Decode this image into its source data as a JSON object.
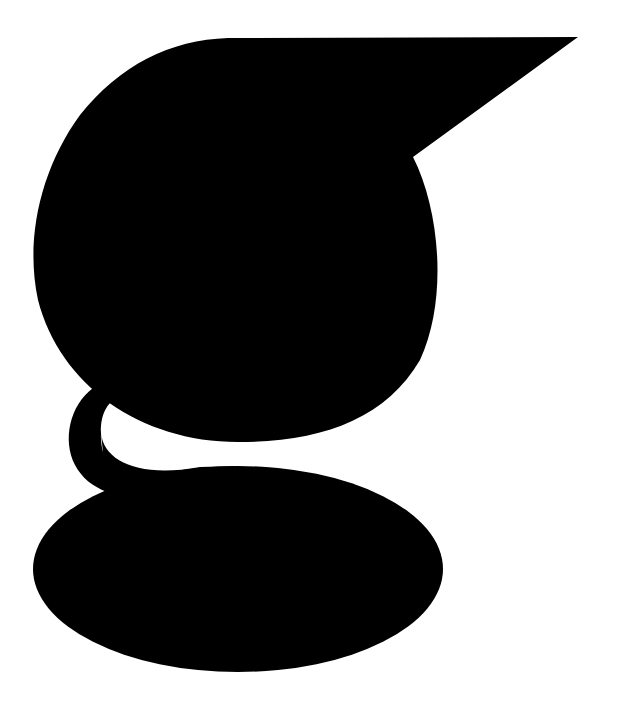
{
  "graphic": {
    "description": "Stylized lowercase g letterform",
    "fill_color": "#000000",
    "background_color": "#ffffff"
  }
}
